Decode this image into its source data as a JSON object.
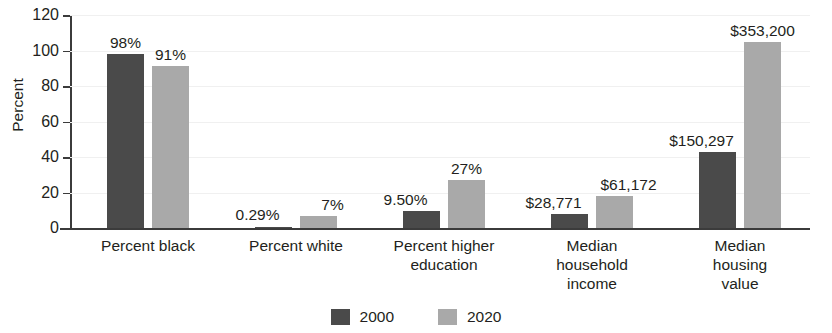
{
  "chart_data": {
    "type": "bar",
    "title": "",
    "xlabel": "",
    "ylabel": "Percent",
    "ylim": [
      0,
      120
    ],
    "yticks": [
      0,
      20,
      40,
      60,
      80,
      100,
      120
    ],
    "grid": true,
    "legend_position": "bottom-center",
    "categories": [
      "Percent black",
      "Percent white",
      "Percent higher\neducation",
      "Median\nhousehold\nincome",
      "Median\nhousing\nvalue"
    ],
    "series": [
      {
        "name": "2000",
        "color": "#4a4a4a",
        "values": [
          98,
          0.29,
          9.5,
          8,
          43
        ],
        "labels": [
          "98%",
          "0.29%",
          "9.50%",
          "$28,771",
          "$150,297"
        ]
      },
      {
        "name": "2020",
        "color": "#a9a9a9",
        "values": [
          91,
          7,
          27,
          18,
          105
        ],
        "labels": [
          "91%",
          "7%",
          "27%",
          "$61,172",
          "$353,200"
        ]
      }
    ]
  },
  "axis": {
    "y_title": "Percent",
    "tick_labels": [
      "120",
      "100",
      "80",
      "60",
      "40",
      "20",
      "0"
    ]
  },
  "legend": {
    "items": [
      {
        "label": "2000",
        "color": "#4a4a4a"
      },
      {
        "label": "2020",
        "color": "#a9a9a9"
      }
    ]
  }
}
